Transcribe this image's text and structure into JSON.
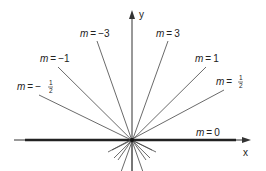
{
  "diagram": {
    "axes": {
      "x_label": "x",
      "y_label": "y"
    },
    "lines": [
      {
        "slope": "-3",
        "label": "m = −3",
        "m": "m",
        "eq": "=",
        "value": "−3"
      },
      {
        "slope": "3",
        "label": "m = 3",
        "m": "m",
        "eq": "=",
        "value": "3"
      },
      {
        "slope": "-1",
        "label": "m = −1",
        "m": "m",
        "eq": "=",
        "value": "−1"
      },
      {
        "slope": "1",
        "label": "m = 1",
        "m": "m",
        "eq": "=",
        "value": "1"
      },
      {
        "slope": "-1/2",
        "label": "m = −½",
        "m": "m",
        "eq": "=",
        "sign": "−",
        "num": "1",
        "den": "2"
      },
      {
        "slope": "1/2",
        "label": "m = ½",
        "m": "m",
        "eq": "=",
        "num": "1",
        "den": "2"
      },
      {
        "slope": "0",
        "label": "m = 0",
        "m": "m",
        "eq": "=",
        "value": "0"
      }
    ],
    "colors": {
      "line": "#333333",
      "axis": "#333333",
      "bold_line": "#222222"
    }
  }
}
